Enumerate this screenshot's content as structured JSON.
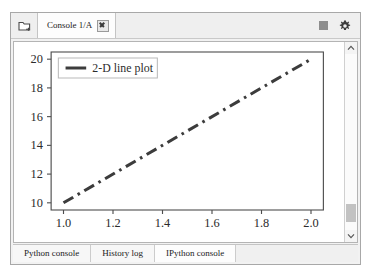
{
  "window": {
    "tabbar": {
      "folder_icon": "folder-icon",
      "tabs": [
        {
          "label": "Console 1/A",
          "close_icon": "close-icon",
          "active": true
        }
      ],
      "tools": [
        {
          "name": "stop-button",
          "icon": "stop-square-icon"
        },
        {
          "name": "options-button",
          "icon": "gear-icon"
        }
      ]
    },
    "scrollbar": {
      "up_icon": "chevron-up-icon",
      "down_icon": "chevron-down-icon"
    },
    "bottom_tabs": [
      {
        "label": "Python console",
        "active": false
      },
      {
        "label": "History log",
        "active": false
      },
      {
        "label": "IPython console",
        "active": true
      }
    ]
  },
  "chart_data": {
    "type": "line",
    "title": "",
    "xlabel": "",
    "ylabel": "",
    "xlim": [
      0.95,
      2.05
    ],
    "ylim": [
      9.5,
      20.5
    ],
    "xticks": [
      "1.0",
      "1.2",
      "1.4",
      "1.6",
      "1.8",
      "2.0"
    ],
    "xtick_values": [
      1.0,
      1.2,
      1.4,
      1.6,
      1.8,
      2.0
    ],
    "yticks": [
      "10",
      "12",
      "14",
      "16",
      "18",
      "20"
    ],
    "ytick_values": [
      10,
      12,
      14,
      16,
      18,
      20
    ],
    "grid": false,
    "legend_position": "upper left",
    "series": [
      {
        "name": "2-D line plot",
        "color": "#3c3c3c",
        "linestyle": "dashdot",
        "linewidth": 3,
        "x": [
          1.0,
          2.0
        ],
        "y": [
          10.0,
          20.0
        ]
      }
    ]
  }
}
